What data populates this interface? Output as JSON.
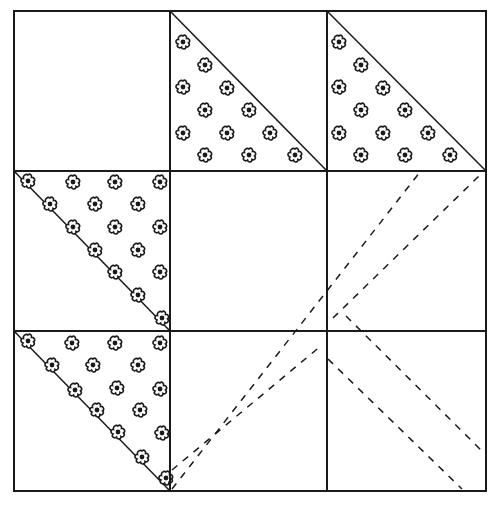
{
  "diagram": {
    "title": "",
    "type": "quilt-block",
    "grid": {
      "rows": 3,
      "cols": 3
    },
    "colors": {
      "line": "#1a1a1a",
      "background": "#ffffff",
      "flower": "#1a1a1a"
    },
    "cells": [
      {
        "row": 0,
        "col": 0,
        "kind": "plain"
      },
      {
        "row": 0,
        "col": 1,
        "kind": "half-square-triangle",
        "print_half": "lower-left",
        "print": "flowers"
      },
      {
        "row": 0,
        "col": 2,
        "kind": "half-square-triangle",
        "print_half": "lower-left",
        "print": "flowers"
      },
      {
        "row": 1,
        "col": 0,
        "kind": "half-square-triangle",
        "print_half": "upper-right",
        "print": "flowers"
      },
      {
        "row": 1,
        "col": 1,
        "kind": "plain"
      },
      {
        "row": 1,
        "col": 2,
        "kind": "plain",
        "guides": "dashed-diagonals"
      },
      {
        "row": 2,
        "col": 0,
        "kind": "half-square-triangle",
        "print_half": "upper-right",
        "print": "flowers"
      },
      {
        "row": 2,
        "col": 1,
        "kind": "plain",
        "guides": "dashed-diagonals"
      },
      {
        "row": 2,
        "col": 2,
        "kind": "plain",
        "guides": "dashed-diagonals"
      }
    ],
    "dashed_guides": [
      {
        "from": [
          170,
          491
        ],
        "to": [
          420,
          171
        ]
      },
      {
        "from": [
          327,
          331
        ],
        "to": [
          486,
          171
        ]
      },
      {
        "from": [
          327,
          331
        ],
        "to": [
          486,
          491
        ]
      },
      {
        "from": [
          327,
          360
        ],
        "to": [
          460,
          491
        ]
      },
      {
        "from": [
          170,
          470
        ],
        "to": [
          320,
          345
        ]
      }
    ],
    "caption": ""
  }
}
